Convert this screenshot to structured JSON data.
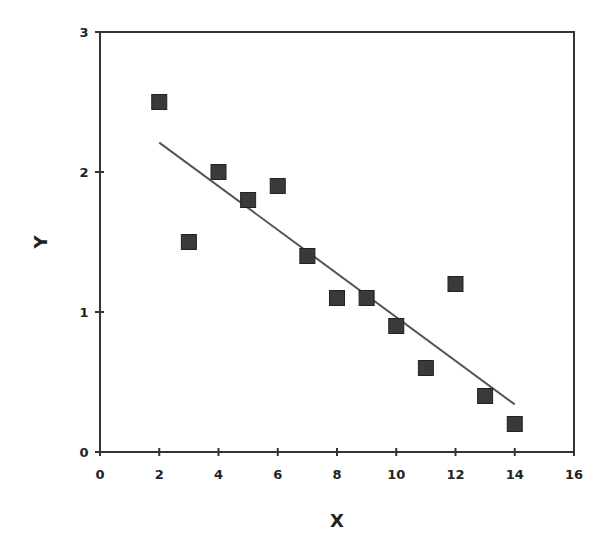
{
  "chart_data": {
    "type": "scatter",
    "title": "",
    "xlabel": "X",
    "ylabel": "Y",
    "xlim": [
      0,
      16
    ],
    "ylim": [
      0,
      3
    ],
    "xticks": [
      0,
      2,
      4,
      6,
      8,
      10,
      12,
      14,
      16
    ],
    "yticks": [
      0,
      1,
      2,
      3
    ],
    "grid": false,
    "legend": null,
    "series": [
      {
        "name": "data",
        "marker": "square",
        "color": "#3a3a3a",
        "x": [
          2,
          3,
          4,
          5,
          6,
          7,
          8,
          9,
          10,
          11,
          12,
          13,
          14
        ],
        "y": [
          2.5,
          1.5,
          2.0,
          1.8,
          1.9,
          1.4,
          1.1,
          1.1,
          0.9,
          0.6,
          1.2,
          0.4,
          0.2
        ]
      },
      {
        "name": "trendline",
        "type": "line",
        "color": "#555555",
        "x": [
          2,
          14
        ],
        "y": [
          2.21,
          0.34
        ]
      }
    ]
  }
}
